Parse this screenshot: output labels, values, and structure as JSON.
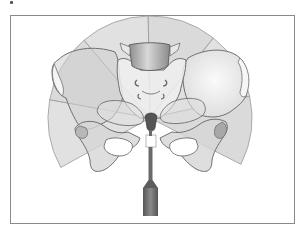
{
  "figure": {
    "colors": {
      "fan_fill": "#d4d4d4",
      "bone_fill": "#e6e6e6",
      "bone_stroke": "#6f6f6f",
      "sacrum_fill": "#9a9a9a",
      "probe_fill": "#6a6a6a",
      "frame_border": "#8a8a8a"
    },
    "fan_sector_count": 6
  }
}
